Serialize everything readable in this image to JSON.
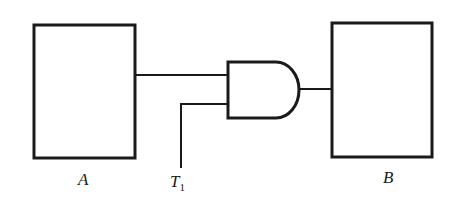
{
  "diagram": {
    "type": "logic-circuit",
    "blocks": [
      {
        "id": "A",
        "label": "A"
      },
      {
        "id": "B",
        "label": "B"
      }
    ],
    "gate": {
      "type": "AND",
      "inputs": [
        "A",
        "T1"
      ],
      "output": "B"
    },
    "signal": {
      "label_main": "T",
      "label_sub": "1"
    },
    "colors": {
      "stroke": "#1a1a1a",
      "background": "#ffffff"
    }
  }
}
